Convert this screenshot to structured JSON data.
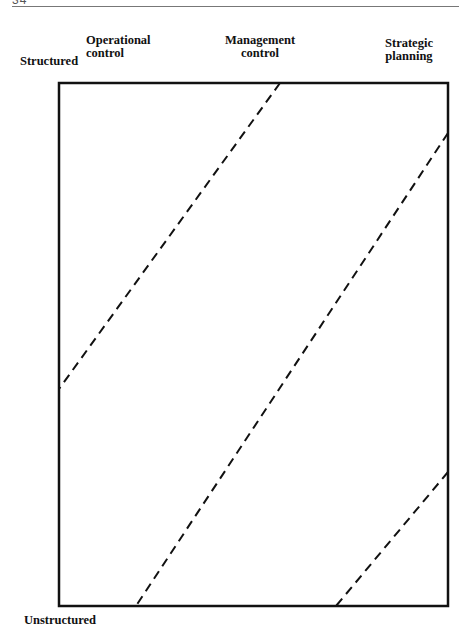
{
  "page": {
    "running_head": "34"
  },
  "diagram": {
    "top_labels": {
      "structured": "Structured",
      "operational": [
        "Operational",
        "control"
      ],
      "management": [
        "Management",
        "control"
      ],
      "strategic": [
        "Strategic",
        "planning"
      ]
    },
    "bottom_label": "Unstructured",
    "line_colors": {
      "frame": "#111111",
      "dashes": "#111111"
    }
  }
}
